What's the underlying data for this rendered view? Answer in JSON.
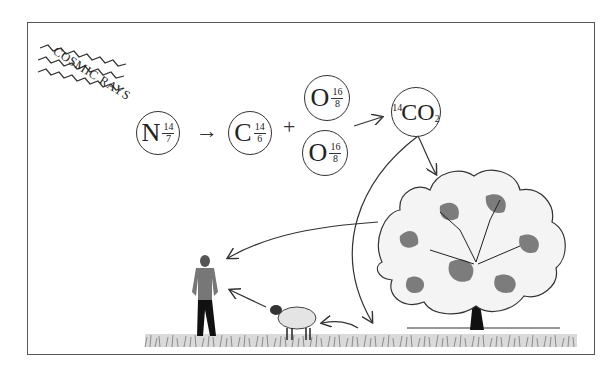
{
  "diagram": {
    "cosmic_rays_label": "COSMIC RAYS",
    "reaction": {
      "nitrogen": {
        "symbol": "N",
        "mass": "14",
        "atomic": "7"
      },
      "arrow1": "→",
      "carbon": {
        "symbol": "C",
        "mass": "14",
        "atomic": "6"
      },
      "plus": "+",
      "oxygen_top": {
        "symbol": "O",
        "mass": "16",
        "atomic": "8"
      },
      "oxygen_bottom": {
        "symbol": "O",
        "mass": "16",
        "atomic": "8"
      },
      "product": {
        "prefix": "14",
        "symbol": "CO",
        "subscript": "2"
      }
    },
    "elements": [
      "cosmic-rays",
      "tree",
      "sheep",
      "man",
      "grass"
    ],
    "colors": {
      "line": "#333333",
      "frame": "#555555",
      "background": "#ffffff"
    }
  }
}
